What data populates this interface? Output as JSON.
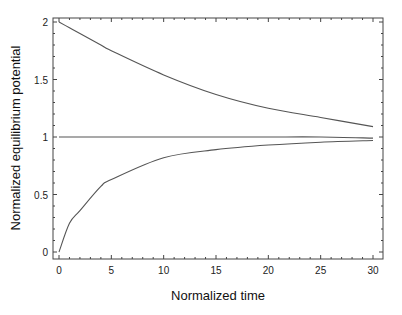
{
  "chart_data": {
    "type": "line",
    "title": "",
    "xlabel": "Normalized time",
    "ylabel": "Normalized equilibrium potential",
    "xlim": [
      0,
      30
    ],
    "ylim": [
      0,
      2
    ],
    "xticks": [
      0,
      5,
      10,
      15,
      20,
      25,
      30
    ],
    "xtick_labels": [
      "0",
      "5",
      "10",
      "15",
      "20",
      "25",
      "30"
    ],
    "yticks": [
      0,
      0.5,
      1,
      1.5,
      2
    ],
    "ytick_labels": [
      "0",
      "0.5",
      "1",
      "1.5",
      "2"
    ],
    "grid": false,
    "legend": null,
    "x": [
      0,
      1,
      2,
      4,
      5,
      10,
      15,
      20,
      25,
      30
    ],
    "series": [
      {
        "name": "upper (decaying from 2)",
        "values": [
          2.0,
          1.95,
          1.9,
          1.8,
          1.75,
          1.54,
          1.37,
          1.25,
          1.17,
          1.09
        ]
      },
      {
        "name": "constant at 1",
        "values": [
          1.0,
          1.0,
          1.0,
          1.0,
          1.0,
          1.0,
          1.0,
          1.0,
          1.0,
          0.99
        ]
      },
      {
        "name": "lower (rising from 0)",
        "values": [
          0.0,
          0.25,
          0.36,
          0.57,
          0.63,
          0.82,
          0.89,
          0.93,
          0.955,
          0.97
        ]
      }
    ],
    "line_color": "#555555"
  }
}
